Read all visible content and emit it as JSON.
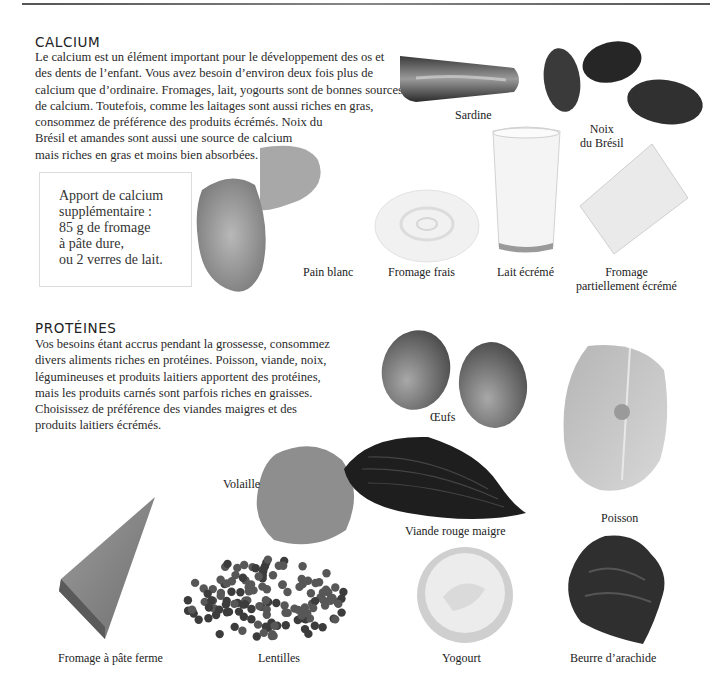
{
  "page": {
    "top_rule": true
  },
  "calcium": {
    "heading": "CALCIUM",
    "paragraph_lines": [
      "Le calcium est un élément important pour le développement des os et",
      "des dents de l’enfant. Vous avez besoin d’environ deux fois plus de",
      "calcium que d’ordinaire. Fromages, lait, yogourts sont de bonnes sources",
      "de calcium. Toutefois, comme les laitages sont aussi riches en gras,",
      "consommez de préférence des produits écrémés. Noix du",
      "Brésil et amandes sont aussi une source de calcium",
      "mais riches en gras et moins bien absorbées."
    ],
    "callout_lines": [
      "Apport de calcium",
      "supplémentaire :",
      "85 g de fromage",
      "à pâte dure,",
      "ou 2 verres de lait."
    ],
    "foods": [
      {
        "id": "sardine",
        "label_lines": [
          "Sardine"
        ]
      },
      {
        "id": "brazil-nuts",
        "label_lines": [
          "Noix",
          "du Brésil"
        ]
      },
      {
        "id": "white-bread",
        "label_lines": [
          "Pain blanc"
        ]
      },
      {
        "id": "fresh-cheese",
        "label_lines": [
          "Fromage frais"
        ]
      },
      {
        "id": "skim-milk",
        "label_lines": [
          "Lait écrémé"
        ]
      },
      {
        "id": "part-skim-cheese",
        "label_lines": [
          "Fromage",
          "partiellement écrémé"
        ]
      }
    ]
  },
  "proteins": {
    "heading": "PROTÉINES",
    "paragraph_lines": [
      "Vos besoins étant accrus pendant la grossesse, consommez",
      "divers aliments riches en protéines. Poisson, viande, noix,",
      "légumineuses et produits laitiers apportent des protéines,",
      "mais les produits carnés sont parfois riches en graisses.",
      "Choisissez de préférence des viandes maigres et des",
      "produits laitiers écrémés."
    ],
    "foods": [
      {
        "id": "eggs",
        "label_lines": [
          "Œufs"
        ]
      },
      {
        "id": "fish",
        "label_lines": [
          "Poisson"
        ]
      },
      {
        "id": "poultry",
        "label_lines": [
          "Volaille"
        ]
      },
      {
        "id": "lean-red-meat",
        "label_lines": [
          "Viande rouge maigre"
        ]
      },
      {
        "id": "hard-cheese",
        "label_lines": [
          "Fromage à pâte ferme"
        ]
      },
      {
        "id": "lentils",
        "label_lines": [
          "Lentilles"
        ]
      },
      {
        "id": "yogurt",
        "label_lines": [
          "Yogourt"
        ]
      },
      {
        "id": "peanut-butter",
        "label_lines": [
          "Beurre d’arachide"
        ]
      }
    ]
  }
}
